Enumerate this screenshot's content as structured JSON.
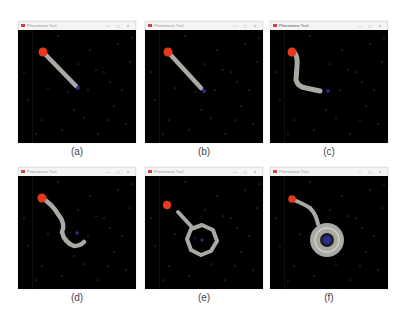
{
  "window_title": "Pheromone Trail",
  "window_controls": {
    "minimize": "–",
    "maximize": "□",
    "close": "×"
  },
  "colors": {
    "background": "#000000",
    "food_source": "#e8391f",
    "trail": "#a8aaa3",
    "nest": "#2b2f8f",
    "particles": "#6a6a6a"
  },
  "panels": [
    {
      "id": "a",
      "caption": "(a)"
    },
    {
      "id": "b",
      "caption": "(b)"
    },
    {
      "id": "c",
      "caption": "(c)"
    },
    {
      "id": "d",
      "caption": "(d)"
    },
    {
      "id": "e",
      "caption": "(e)"
    },
    {
      "id": "f",
      "caption": "(f)"
    }
  ]
}
